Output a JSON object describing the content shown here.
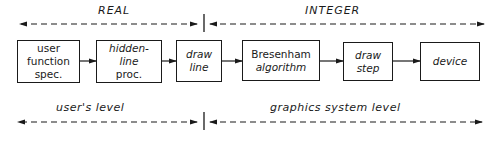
{
  "top_band": {
    "left_label": "REAL",
    "right_label": "INTEGER"
  },
  "bottom_band": {
    "left_label": "user's level",
    "right_label": "graphics system level"
  },
  "boxes": [
    {
      "id": "user-function-spec",
      "lines": [
        "user",
        "function",
        "spec."
      ]
    },
    {
      "id": "hidden-line-proc",
      "lines": [
        "hidden-",
        "line",
        "proc."
      ]
    },
    {
      "id": "draw-line",
      "lines": [
        "draw",
        "line"
      ]
    },
    {
      "id": "bresenham-algorithm",
      "lines": [
        "Bresenham",
        "algorithm"
      ]
    },
    {
      "id": "draw-step",
      "lines": [
        "draw",
        "step"
      ]
    },
    {
      "id": "device",
      "lines": [
        "device"
      ]
    }
  ],
  "flow": [
    "user function spec.",
    "hidden-line proc.",
    "draw line",
    "Bresenham algorithm",
    "draw step",
    "device"
  ]
}
